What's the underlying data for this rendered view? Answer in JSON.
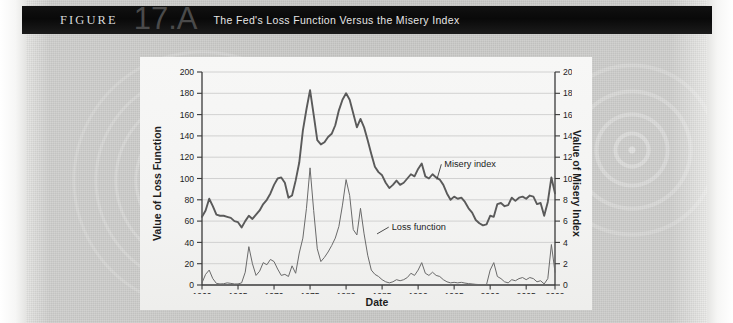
{
  "figure": {
    "label": "FIGURE",
    "number": "17.A",
    "title": "The Fed's Loss Function Versus the Misery Index"
  },
  "colors": {
    "header_bg": "#0b0b0b",
    "header_text": "#e6e6e6",
    "figure_number": "#4a4a4a",
    "page_bg": "#c9c9c7",
    "panel_bg": "#f5f5f4",
    "grid": "#c8c8c8",
    "axis": "#3a3a3a",
    "series_misery": "#5a5a5a",
    "series_loss": "#6a6a6a"
  },
  "chart_data": {
    "type": "line",
    "title": "The Fed's Loss Function Versus the Misery Index",
    "xlabel": "Date",
    "ylabel": "Value of Loss Function",
    "y2label": "Value of Misery Index",
    "xlim": [
      1960,
      2009
    ],
    "ylim": [
      0,
      200
    ],
    "y2lim": [
      0,
      20
    ],
    "xticks": [
      1960,
      1965,
      1970,
      1975,
      1980,
      1985,
      1990,
      1995,
      2000,
      2005,
      2009
    ],
    "xticklabels": [
      "1960",
      "1965",
      "1970",
      "1975",
      "1980",
      "1985",
      "1990",
      "1995",
      "2000",
      "2005",
      "2009"
    ],
    "yticks": [
      0,
      20,
      40,
      60,
      80,
      100,
      120,
      140,
      160,
      180,
      200
    ],
    "yticklabels": [
      "0",
      "20",
      "40",
      "60",
      "80",
      "100",
      "120",
      "140",
      "160",
      "180",
      "200"
    ],
    "y2ticks": [
      0,
      2,
      4,
      6,
      8,
      10,
      12,
      14,
      16,
      18,
      20
    ],
    "y2ticklabels": [
      "0",
      "2",
      "4",
      "6",
      "8",
      "10",
      "12",
      "14",
      "16",
      "18",
      "20"
    ],
    "grid": true,
    "grid_axis": "y",
    "legend": "annotations",
    "annotations": [
      {
        "text": "Misery index",
        "x": 1993.5,
        "y2": 11.1,
        "point_x": 1992.6,
        "point_y2": 9.9
      },
      {
        "text": "Loss function",
        "x": 1986.2,
        "y": 52.0,
        "point_x": 1984.3,
        "point_y": 48.0
      }
    ],
    "series": [
      {
        "name": "Misery index",
        "axis": "right",
        "unit": "index",
        "x": [
          1960.0,
          1960.5,
          1961.0,
          1961.5,
          1962.0,
          1962.5,
          1963.0,
          1963.5,
          1964.0,
          1964.5,
          1965.0,
          1965.5,
          1966.0,
          1966.5,
          1967.0,
          1967.5,
          1968.0,
          1968.5,
          1969.0,
          1969.5,
          1970.0,
          1970.5,
          1971.0,
          1971.5,
          1972.0,
          1972.5,
          1973.0,
          1973.5,
          1974.0,
          1974.5,
          1975.0,
          1975.5,
          1976.0,
          1976.5,
          1977.0,
          1977.5,
          1978.0,
          1978.5,
          1979.0,
          1979.5,
          1980.0,
          1980.5,
          1981.0,
          1981.5,
          1982.0,
          1982.5,
          1983.0,
          1983.5,
          1984.0,
          1984.5,
          1985.0,
          1985.5,
          1986.0,
          1986.5,
          1987.0,
          1987.5,
          1988.0,
          1988.5,
          1989.0,
          1989.5,
          1990.0,
          1990.5,
          1991.0,
          1991.5,
          1992.0,
          1992.5,
          1993.0,
          1993.5,
          1994.0,
          1994.5,
          1995.0,
          1995.5,
          1996.0,
          1996.5,
          1997.0,
          1997.5,
          1998.0,
          1998.5,
          1999.0,
          1999.5,
          2000.0,
          2000.5,
          2001.0,
          2001.5,
          2002.0,
          2002.5,
          2003.0,
          2003.5,
          2004.0,
          2004.5,
          2005.0,
          2005.5,
          2006.0,
          2006.5,
          2007.0,
          2007.5,
          2008.0,
          2008.5,
          2009.0
        ],
        "y": [
          6.4,
          7.0,
          8.1,
          7.4,
          6.6,
          6.5,
          6.5,
          6.4,
          6.3,
          6.0,
          5.9,
          5.4,
          6.0,
          6.5,
          6.2,
          6.6,
          7.0,
          7.6,
          8.0,
          8.6,
          9.4,
          10.0,
          10.1,
          9.6,
          8.2,
          8.4,
          9.8,
          11.5,
          14.5,
          16.5,
          18.3,
          16.0,
          13.6,
          13.2,
          13.4,
          13.9,
          14.2,
          15.0,
          16.4,
          17.4,
          18.0,
          17.4,
          16.1,
          14.8,
          15.6,
          14.8,
          13.6,
          12.3,
          11.1,
          10.6,
          10.3,
          9.6,
          9.1,
          9.4,
          9.8,
          9.4,
          9.6,
          10.0,
          10.4,
          10.2,
          10.9,
          11.4,
          10.2,
          10.0,
          10.4,
          10.1,
          9.9,
          9.4,
          8.6,
          8.0,
          8.3,
          8.1,
          8.2,
          7.8,
          7.2,
          6.8,
          6.1,
          5.8,
          5.6,
          5.7,
          6.5,
          6.4,
          7.6,
          7.7,
          7.4,
          7.5,
          8.2,
          7.9,
          8.2,
          8.3,
          8.1,
          8.4,
          8.3,
          7.6,
          7.7,
          6.5,
          7.8,
          10.1,
          8.6
        ]
      },
      {
        "name": "Loss function",
        "axis": "left",
        "unit": "value",
        "x": [
          1960.0,
          1960.5,
          1961.0,
          1961.5,
          1962.0,
          1962.5,
          1963.0,
          1963.5,
          1964.0,
          1964.5,
          1965.0,
          1965.5,
          1966.0,
          1966.5,
          1967.0,
          1967.5,
          1968.0,
          1968.5,
          1969.0,
          1969.5,
          1970.0,
          1970.5,
          1971.0,
          1971.5,
          1972.0,
          1972.5,
          1973.0,
          1973.5,
          1974.0,
          1974.5,
          1975.0,
          1975.5,
          1976.0,
          1976.5,
          1977.0,
          1977.5,
          1978.0,
          1978.5,
          1979.0,
          1979.5,
          1980.0,
          1980.5,
          1981.0,
          1981.5,
          1982.0,
          1982.5,
          1983.0,
          1983.5,
          1984.0,
          1984.5,
          1985.0,
          1985.5,
          1986.0,
          1986.5,
          1987.0,
          1987.5,
          1988.0,
          1988.5,
          1989.0,
          1989.5,
          1990.0,
          1990.5,
          1991.0,
          1991.5,
          1992.0,
          1992.5,
          1993.0,
          1993.5,
          1994.0,
          1994.5,
          1995.0,
          1995.5,
          1996.0,
          1996.5,
          1997.0,
          1997.5,
          1998.0,
          1998.5,
          1999.0,
          1999.5,
          2000.0,
          2000.5,
          2001.0,
          2001.5,
          2002.0,
          2002.5,
          2003.0,
          2003.5,
          2004.0,
          2004.5,
          2005.0,
          2005.5,
          2006.0,
          2006.5,
          2007.0,
          2007.5,
          2008.0,
          2008.5,
          2009.0
        ],
        "y": [
          2.0,
          10.0,
          14.0,
          6.0,
          1.5,
          1.0,
          1.2,
          2.0,
          1.5,
          1.0,
          1.0,
          2.0,
          12.0,
          36.0,
          20.0,
          9.0,
          13.0,
          21.0,
          19.0,
          24.0,
          22.0,
          15.0,
          9.0,
          10.0,
          8.0,
          18.0,
          11.0,
          30.0,
          44.0,
          72.0,
          110.0,
          70.0,
          34.0,
          22.0,
          26.0,
          31.0,
          37.0,
          44.0,
          55.0,
          75.0,
          99.0,
          84.0,
          52.0,
          47.0,
          72.0,
          48.0,
          28.0,
          14.0,
          10.0,
          8.0,
          5.0,
          3.0,
          2.0,
          3.0,
          5.0,
          4.0,
          5.0,
          7.0,
          11.0,
          9.0,
          14.0,
          21.0,
          11.0,
          9.0,
          12.0,
          9.0,
          8.0,
          5.0,
          3.0,
          2.0,
          2.5,
          2.0,
          2.5,
          1.8,
          1.3,
          1.0,
          0.6,
          0.4,
          0.3,
          0.5,
          14.0,
          21.0,
          8.0,
          6.0,
          3.0,
          2.0,
          5.0,
          4.0,
          6.0,
          7.0,
          5.0,
          7.0,
          6.0,
          3.0,
          4.0,
          1.0,
          6.0,
          38.0,
          12.0
        ]
      }
    ]
  }
}
